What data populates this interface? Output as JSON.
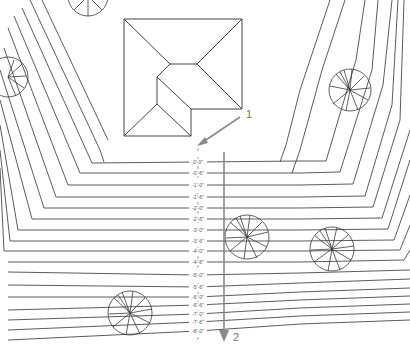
{
  "drawing": {
    "type": "site grading plan",
    "background": "#ffffff",
    "line_color": "#4a4a4a",
    "arrow_color": "#8a8a8a"
  },
  "callouts": [
    {
      "id": "1",
      "label": "1"
    },
    {
      "id": "2",
      "label": "2"
    }
  ],
  "elevations": [
    "0'-0\"",
    "-0'-6\"",
    "-1'-0\"",
    "-1'-6\"",
    "-2'-0\"",
    "-2'-6\"",
    "-3'-0\"",
    "-3'-6\"",
    "-4'-0\"",
    "-4'-6\"",
    "-5'-0\"",
    "-5'-6\"",
    "-6'-0\"",
    "-6'-6\"",
    "-7'-0\"",
    "-7'-6\"",
    "-8'-0\""
  ],
  "elevation_y": [
    162,
    173,
    185,
    197,
    208,
    219,
    230,
    241,
    251,
    262,
    275,
    287,
    297,
    305,
    314,
    322,
    331
  ],
  "trees": [
    {
      "name": "tree-top-right",
      "cx": 350,
      "cy": 90,
      "r": 21
    },
    {
      "name": "tree-center",
      "cx": 247,
      "cy": 237,
      "r": 22
    },
    {
      "name": "tree-right",
      "cx": 332,
      "cy": 249,
      "r": 22
    },
    {
      "name": "tree-bottom-left",
      "cx": 130,
      "cy": 313,
      "r": 22
    },
    {
      "name": "tree-left-edge",
      "cx": 8,
      "cy": 77,
      "r": 20
    },
    {
      "name": "tree-top-partial",
      "cx": 88,
      "cy": -4,
      "r": 20
    }
  ]
}
